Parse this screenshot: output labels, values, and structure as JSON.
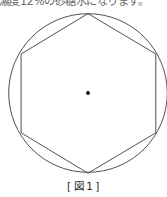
{
  "page": {
    "background_color": "#ffffff",
    "width": 167,
    "height": 197
  },
  "top_text": {
    "text": "濃度12%の砂糖水になります。",
    "clipped": "true",
    "color": "#4a4a4a"
  },
  "figure": {
    "name": "hexagon-inscribed-in-circle",
    "stroke_color": "#3c3c46",
    "center_dot_color": "#000000",
    "circle": {
      "cx": 88,
      "cy": 85,
      "r": 79.5
    },
    "hexagon_vertices": [
      {
        "x": 88,
        "y": 5
      },
      {
        "x": 156,
        "y": 46
      },
      {
        "x": 156,
        "y": 125
      },
      {
        "x": 88,
        "y": 165
      },
      {
        "x": 21,
        "y": 125
      },
      {
        "x": 21,
        "y": 46
      }
    ],
    "center_dot": {
      "x": 88,
      "y": 85,
      "r": 1.9
    }
  },
  "caption": {
    "open_bracket": "[",
    "label": "図",
    "number": "1",
    "close_bracket": "]",
    "full": "[図1]"
  }
}
